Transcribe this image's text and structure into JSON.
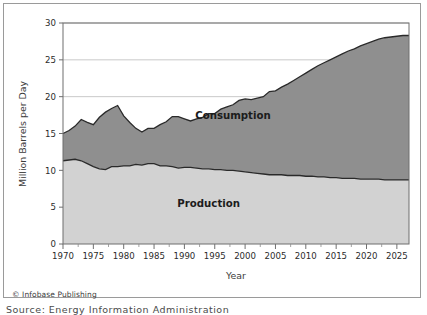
{
  "figure": {
    "copyright": "© Infobase Publishing",
    "source_note": "Source: Energy Information Administration"
  },
  "chart_data": {
    "type": "area",
    "stacked": true,
    "title": "",
    "xlabel": "Year",
    "ylabel": "Million Barrels per Day",
    "xlim": [
      1970,
      2027
    ],
    "ylim": [
      0,
      30
    ],
    "yticks": [
      0,
      5,
      10,
      15,
      20,
      25,
      30
    ],
    "ytick_labels": [
      "0",
      "5",
      "10",
      "15",
      "20",
      "25",
      "30"
    ],
    "xticks": [
      1970,
      1975,
      1980,
      1985,
      1990,
      1995,
      2000,
      2005,
      2010,
      2015,
      2020,
      2025
    ],
    "xtick_labels": [
      "1970",
      "1975",
      "1980",
      "1985",
      "1990",
      "1995",
      "2000",
      "2005",
      "2010",
      "2015",
      "2020",
      "2025"
    ],
    "x_minor_tick_interval": 2.5,
    "grid": "horizontal",
    "grid_color": "#c9c9c9",
    "legend_position": "inline-annotation",
    "annotations": [
      {
        "text": "Consumption",
        "x": 1998,
        "y": 17.0
      },
      {
        "text": "Production",
        "x": 1994,
        "y": 5.0
      }
    ],
    "series": [
      {
        "name": "Production",
        "fill_color": "#d2d2d2",
        "line_color": "#2a2a2a",
        "x": [
          1970,
          1971,
          1972,
          1973,
          1974,
          1975,
          1976,
          1977,
          1978,
          1979,
          1980,
          1981,
          1982,
          1983,
          1984,
          1985,
          1986,
          1987,
          1988,
          1989,
          1990,
          1991,
          1992,
          1993,
          1994,
          1995,
          1996,
          1997,
          1998,
          1999,
          2000,
          2001,
          2002,
          2003,
          2004,
          2005,
          2006,
          2007,
          2008,
          2009,
          2010,
          2011,
          2012,
          2013,
          2014,
          2015,
          2016,
          2017,
          2018,
          2019,
          2020,
          2021,
          2022,
          2023,
          2024,
          2025,
          2026,
          2027
        ],
        "values": [
          11.3,
          11.2,
          11.2,
          11.0,
          10.5,
          10.0,
          10.0,
          10.1,
          10.3,
          10.2,
          10.2,
          10.2,
          10.6,
          10.6,
          10.7,
          10.6,
          10.2,
          10.0,
          9.8,
          9.2,
          9.0,
          9.1,
          8.9,
          8.6,
          8.5,
          8.4,
          8.3,
          8.3,
          8.0,
          7.7,
          7.7,
          7.7,
          7.6,
          7.4,
          7.2,
          6.9,
          6.8,
          6.9,
          6.7,
          7.2,
          7.5,
          7.9,
          8.9,
          10.0,
          11.7,
          12.7,
          12.3,
          13.1,
          15.3,
          17.1,
          16.5,
          16.9,
          17.8,
          18.3,
          18.6,
          18.8,
          18.9,
          19.0
        ],
        "values_as_drawn": [
          11.3,
          11.4,
          11.5,
          11.3,
          10.9,
          10.5,
          10.2,
          10.1,
          10.5,
          10.5,
          10.6,
          10.6,
          10.8,
          10.7,
          10.9,
          10.9,
          10.6,
          10.6,
          10.5,
          10.3,
          10.4,
          10.4,
          10.3,
          10.2,
          10.2,
          10.1,
          10.1,
          10.0,
          10.0,
          9.9,
          9.8,
          9.7,
          9.6,
          9.5,
          9.4,
          9.4,
          9.4,
          9.3,
          9.3,
          9.3,
          9.2,
          9.2,
          9.1,
          9.1,
          9.0,
          9.0,
          8.9,
          8.9,
          8.9,
          8.8,
          8.8,
          8.8,
          8.8,
          8.7,
          8.7,
          8.7,
          8.7,
          8.7
        ]
      },
      {
        "name": "Consumption",
        "fill_color": "#8f8f8f",
        "line_color": "#2a2a2a",
        "x": [
          1970,
          1971,
          1972,
          1973,
          1974,
          1975,
          1976,
          1977,
          1978,
          1979,
          1980,
          1981,
          1982,
          1983,
          1984,
          1985,
          1986,
          1987,
          1988,
          1989,
          1990,
          1991,
          1992,
          1993,
          1994,
          1995,
          1996,
          1997,
          1998,
          1999,
          2000,
          2001,
          2002,
          2003,
          2004,
          2005,
          2006,
          2007,
          2008,
          2009,
          2010,
          2011,
          2012,
          2013,
          2014,
          2015,
          2016,
          2017,
          2018,
          2019,
          2020,
          2021,
          2022,
          2023,
          2024,
          2025,
          2026,
          2027
        ],
        "values": [
          15.0,
          15.4,
          16.0,
          16.9,
          16.5,
          16.2,
          17.2,
          17.9,
          18.4,
          18.8,
          17.4,
          16.5,
          15.7,
          15.2,
          15.7,
          15.7,
          16.2,
          16.6,
          17.3,
          17.3,
          17.0,
          16.7,
          17.0,
          17.2,
          17.7,
          17.7,
          18.3,
          18.6,
          18.9,
          19.5,
          19.7,
          19.6,
          19.8,
          20.0,
          20.7,
          20.8,
          21.3,
          21.7,
          22.2,
          22.7,
          23.2,
          23.7,
          24.2,
          24.6,
          25.0,
          25.4,
          25.8,
          26.2,
          26.5,
          26.9,
          27.2,
          27.5,
          27.8,
          28.0,
          28.1,
          28.2,
          28.3,
          28.3
        ]
      }
    ]
  }
}
